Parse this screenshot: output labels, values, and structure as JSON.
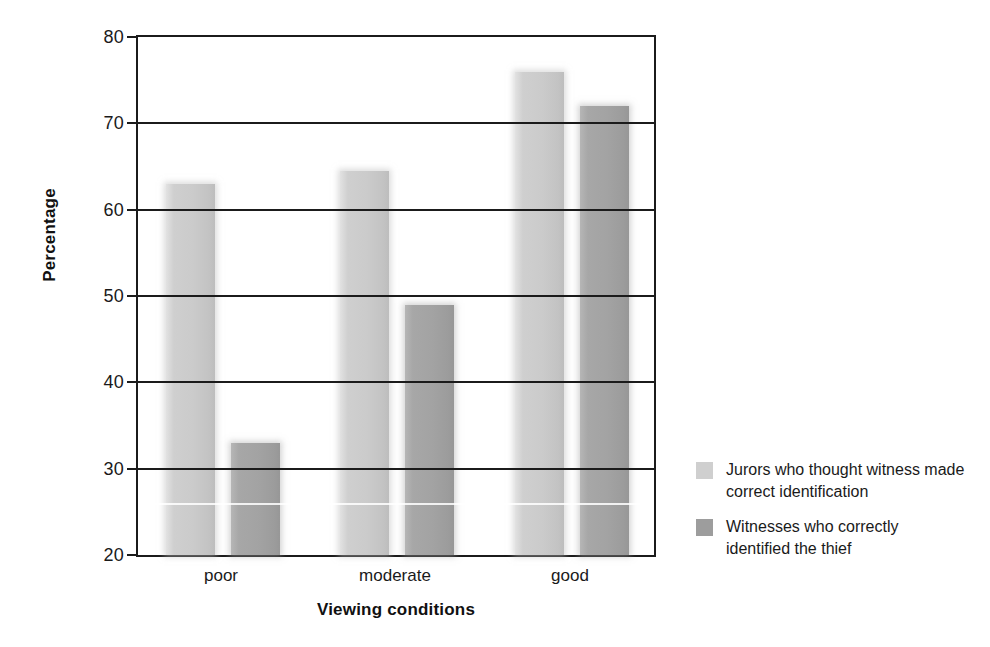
{
  "chart_data": {
    "type": "bar",
    "title": "",
    "xlabel": "Viewing conditions",
    "ylabel": "Percentage",
    "categories": [
      "poor",
      "moderate",
      "good"
    ],
    "ylim": [
      20,
      80
    ],
    "yticks": [
      20,
      30,
      40,
      50,
      60,
      70,
      80
    ],
    "ytick_labels": [
      "20",
      "30",
      "40",
      "50",
      "60",
      "70",
      "80"
    ],
    "grid": true,
    "legend_position": "right",
    "series": [
      {
        "name": "Jurors who thought witness made correct identification",
        "color": "#cfcfcf",
        "values": [
          63,
          64.5,
          76
        ]
      },
      {
        "name": "Witnesses who correctly identified the thief",
        "color": "#9d9d9d",
        "values": [
          33,
          49,
          72
        ]
      }
    ]
  },
  "axes": {
    "y_title": "Percentage",
    "x_title": "Viewing conditions",
    "y_tick_labels": [
      "80",
      "70",
      "60",
      "50",
      "40",
      "30",
      "20"
    ],
    "x_tick_labels": [
      "poor",
      "moderate",
      "good"
    ]
  },
  "legend": {
    "entries": [
      {
        "label": "Jurors who thought witness made correct identification",
        "color": "#cfcfcf"
      },
      {
        "label": "Witnesses who correctly identified the thief",
        "color": "#9d9d9d"
      }
    ]
  }
}
